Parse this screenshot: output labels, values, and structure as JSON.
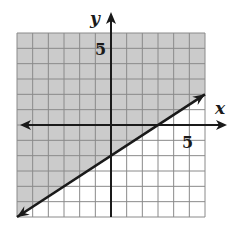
{
  "chart_data": {
    "type": "line",
    "title": "",
    "xlabel": "x",
    "ylabel": "y",
    "xlim": [
      -6,
      6
    ],
    "ylim": [
      -6,
      6
    ],
    "grid": true,
    "grid_step": 1,
    "tick_labels": {
      "x": [
        "5"
      ],
      "y": [
        "5"
      ]
    },
    "series": [
      {
        "name": "boundary line",
        "equation": "y = (2/3)x - 2",
        "style": "solid",
        "x": [
          -6,
          0,
          3,
          6
        ],
        "y": [
          -6,
          -2,
          0,
          2
        ]
      }
    ],
    "shaded_region": {
      "inequality": "y >= (2/3)x - 2",
      "side": "above line",
      "color": "#c8c8c8"
    }
  },
  "labels": {
    "x_axis": "x",
    "y_axis": "y",
    "x_tick": "5",
    "y_tick": "5"
  },
  "colors": {
    "shade": "#cbcbcb",
    "grid": "#8a8a8a",
    "axis": "#1a1a1a",
    "line": "#1a1a1a"
  }
}
